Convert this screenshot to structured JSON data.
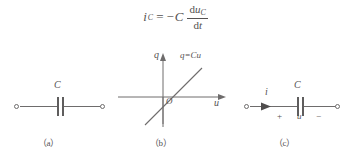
{
  "formula": {
    "lhs_symbol": "i",
    "lhs_subscript": "C",
    "equals": "=",
    "minus": "−",
    "coefficient": "C",
    "numerator_d": "d",
    "numerator_var": "u",
    "numerator_subscript": "C",
    "denominator": "d",
    "denominator_var": "t",
    "full_text": "i_C = -C du_C/dt"
  },
  "figures": [
    {
      "caption": "（a）",
      "capacitor_label": "C",
      "description": "capacitor symbol with two open terminals"
    },
    {
      "caption": "（b）",
      "y_axis_label": "q",
      "x_axis_label": "u",
      "origin_label": "O",
      "line_label": "q=Cu",
      "description": "charge versus voltage characteristic, straight line through origin"
    },
    {
      "caption": "（c）",
      "current_label": "i",
      "capacitor_label": "C",
      "voltage_label": "u",
      "polarity_positive": "+",
      "polarity_negative": "−",
      "description": "capacitor with reference current direction and voltage polarity"
    }
  ],
  "colors": {
    "ink": "#555252",
    "line": "#6e6c6c",
    "background": "#ffffff"
  }
}
